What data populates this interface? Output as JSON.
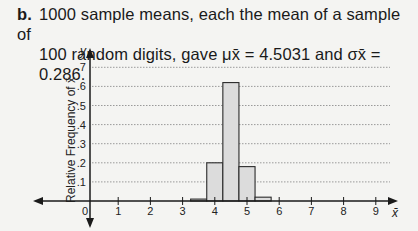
{
  "caption": {
    "label": "b.",
    "line1": "1000 sample means, each the mean of a sample of",
    "line2": "100 random digits, gave μx̄ = 4.5031 and σx̄ = 0.286."
  },
  "chart_data": {
    "type": "bar",
    "title": "",
    "xlabel": "x̄",
    "ylabel": "Relative Frequency of x̄",
    "y_axis_name": "y",
    "x_ticks": [
      "0",
      "1",
      "2",
      "3",
      "4",
      "5",
      "6",
      "7",
      "8",
      "9"
    ],
    "y_ticks": [
      ".1",
      ".2",
      ".3",
      ".4",
      ".5",
      ".6",
      ".7"
    ],
    "xlim": [
      0,
      9.5
    ],
    "ylim": [
      0,
      0.75
    ],
    "grid": "horizontal dotted",
    "bin_width": 0.5,
    "categories": [
      "3.5",
      "4.0",
      "4.5",
      "5.0",
      "5.5"
    ],
    "values": [
      0.01,
      0.2,
      0.62,
      0.18,
      0.02
    ],
    "stats": {
      "mean": 4.5031,
      "sd": 0.286,
      "n_samples": 1000,
      "sample_size": 100
    }
  },
  "colors": {
    "bar_fill": "#dcdcdc",
    "bar_stroke": "#2a2a2a",
    "grid": "#9a9a9a",
    "axis": "#1a1a1a"
  }
}
